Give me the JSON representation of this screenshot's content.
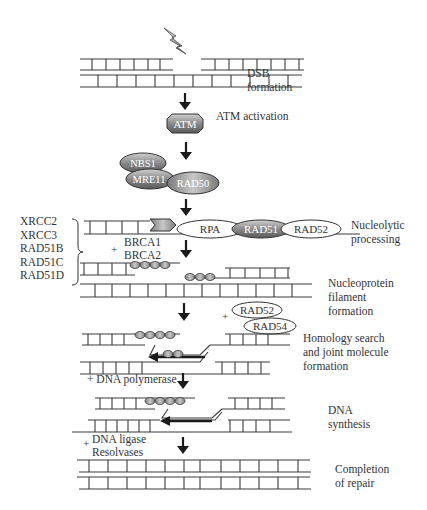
{
  "steps": [
    {
      "id": "dsb",
      "label_lines": [
        "DSB",
        "formation"
      ]
    },
    {
      "id": "atm",
      "label_lines": [
        "ATM activation"
      ]
    },
    {
      "id": "nucleolytic",
      "label_lines": [
        "Nucleolytic",
        "processing"
      ]
    },
    {
      "id": "nucleoprotein",
      "label_lines": [
        "Nucleoprotein",
        "filament",
        "formation"
      ]
    },
    {
      "id": "homology",
      "label_lines": [
        "Homology search",
        "and joint molecule",
        "formation"
      ]
    },
    {
      "id": "synthesis",
      "label_lines": [
        "DNA",
        "synthesis"
      ]
    },
    {
      "id": "completion",
      "label_lines": [
        "Completion",
        "of repair"
      ]
    }
  ],
  "proteins": {
    "atm": "ATM",
    "nbs1": "NBS1",
    "mre11": "MRE11",
    "rad50": "RAD50",
    "rpa": "RPA",
    "rad51": "RAD51",
    "rad52": "RAD52",
    "rad52b": "RAD52",
    "rad54": "RAD54"
  },
  "paralogs": [
    "XRCC2",
    "XRCC3",
    "RAD51B",
    "RAD51C",
    "RAD51D"
  ],
  "additions": {
    "brca": {
      "plus": "+",
      "lines": [
        "BRCA1",
        "BRCA2"
      ]
    },
    "rad52_54_plus": "+",
    "polymerase": "+ DNA polymerase",
    "ligase": {
      "plus": "+",
      "lines": [
        "DNA ligase",
        "Resolvases"
      ]
    }
  },
  "colors": {
    "line": "#3a3a3a",
    "protein_dark": "#8a8a8a",
    "protein_mid": "#a8a8a8",
    "protein_light": "#ffffff",
    "arrow": "#1a1a1a"
  }
}
